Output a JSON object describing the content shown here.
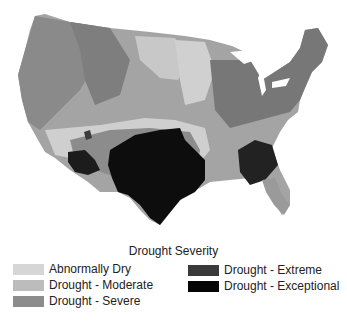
{
  "map": {
    "title": "Drought Severity",
    "region": "Contiguous United States",
    "colors": {
      "land_base": "#a8a8a8",
      "east": "#7a7a7a",
      "west": "#8c8c8c",
      "abnormally_dry": "#d4d4d4",
      "moderate": "#bdbdbd",
      "severe": "#8e8e8e",
      "extreme": "#3d3d3d",
      "exceptional": "#0a0a0a"
    }
  },
  "legend": {
    "title": "Drought Severity",
    "items": [
      {
        "label": "Abnormally Dry",
        "color": "#d6d6d6"
      },
      {
        "label": "Drought - Moderate",
        "color": "#bcbcbc"
      },
      {
        "label": "Drought - Severe",
        "color": "#8c8c8c"
      },
      {
        "label": "Drought - Extreme",
        "color": "#3a3a3a"
      },
      {
        "label": "Drought - Exceptional",
        "color": "#050505"
      }
    ]
  }
}
